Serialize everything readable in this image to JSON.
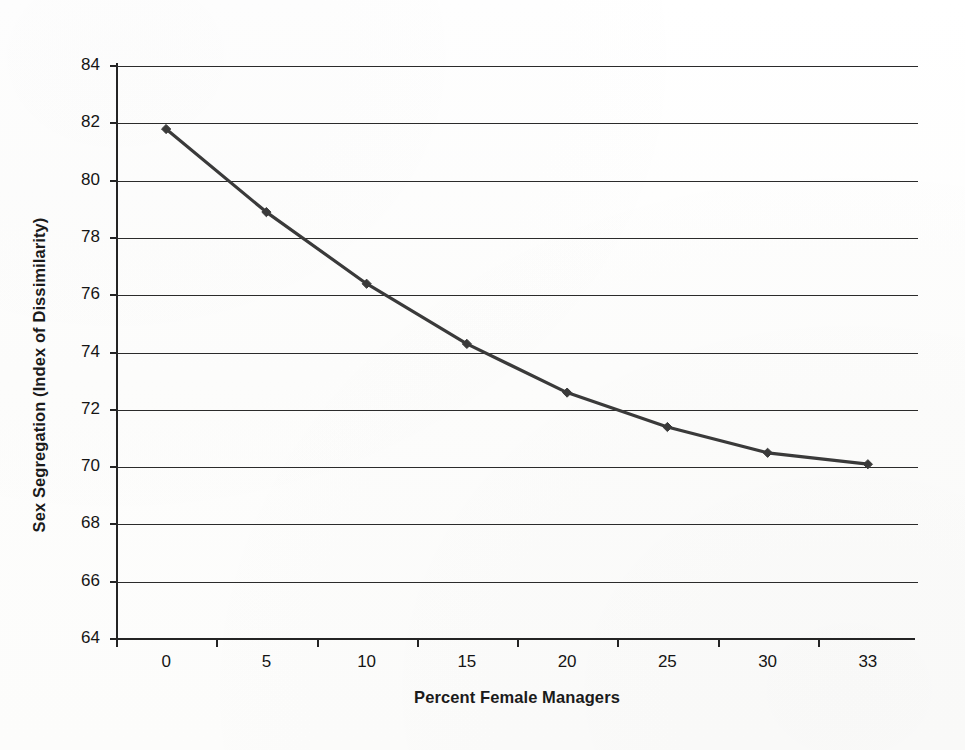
{
  "chart_data": {
    "type": "line",
    "title": "",
    "xlabel": "Percent Female Managers",
    "ylabel": "Sex Segregation (Index of Dissimilarity)",
    "categories": [
      "0",
      "5",
      "10",
      "15",
      "20",
      "25",
      "30",
      "33"
    ],
    "x": [
      0,
      5,
      10,
      15,
      20,
      25,
      30,
      33
    ],
    "values": [
      81.8,
      78.9,
      76.4,
      74.3,
      72.6,
      71.4,
      70.5,
      70.1
    ],
    "series": [
      {
        "name": "Sex Segregation",
        "values": [
          81.8,
          78.9,
          76.4,
          74.3,
          72.6,
          71.4,
          70.5,
          70.1
        ],
        "color": "#3a3a3a",
        "marker": "diamond"
      }
    ],
    "ylim": [
      64,
      84
    ],
    "ytick_labels": [
      "84",
      "82",
      "80",
      "78",
      "76",
      "74",
      "72",
      "70",
      "68",
      "66",
      "64"
    ],
    "yticks": [
      84,
      82,
      80,
      78,
      76,
      74,
      72,
      70,
      68,
      66,
      64
    ],
    "ystep": 2,
    "grid": "horizontal",
    "legend": "none",
    "line_color": "#3a3a3a",
    "axis_color": "#242424",
    "background_color": "#fefefe"
  },
  "axes": {
    "y_title": "Sex Segregation (Index of Dissimilarity)",
    "x_title": "Percent Female Managers"
  }
}
